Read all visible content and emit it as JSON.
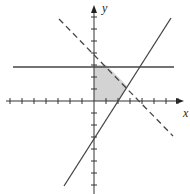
{
  "graph": {
    "axes": {
      "x_label": "x",
      "y_label": "y",
      "x_ticks": [
        -7,
        -6,
        -5,
        -4,
        -3,
        -2,
        -1,
        1,
        2,
        3,
        4,
        5,
        6,
        7
      ],
      "y_ticks": [
        -7,
        -6,
        -5,
        -4,
        -3,
        -2,
        -1,
        1,
        2,
        3,
        4,
        5,
        6,
        7
      ]
    },
    "lines": [
      {
        "name": "horizontal",
        "equation": "y = 3",
        "style": "solid"
      },
      {
        "name": "increasing",
        "equation": "y = 1.5x - 3",
        "style": "solid"
      },
      {
        "name": "decreasing",
        "equation": "y = -x + 4",
        "style": "dashed"
      }
    ],
    "shaded_region": {
      "vertices": [
        [
          0,
          0
        ],
        [
          2,
          0
        ],
        [
          2.8,
          1.2
        ],
        [
          1,
          3
        ],
        [
          0,
          3
        ]
      ],
      "color": "#d0d0d0"
    }
  }
}
